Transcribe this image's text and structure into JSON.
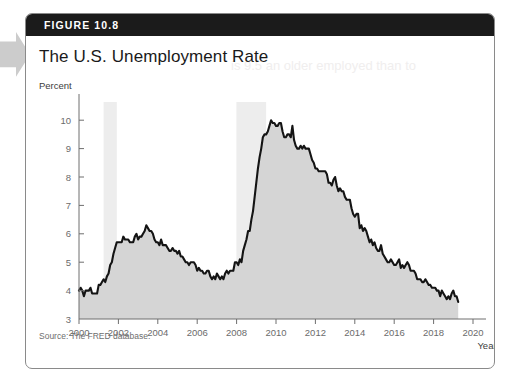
{
  "figure": {
    "header_label": "FIGURE 10.8",
    "title": "The U.S. Unemployment Rate",
    "source": "Source: The FRED database.",
    "bleed_text": "is 9.5 an older employed than to"
  },
  "colors": {
    "header_bg": "#1b1b1b",
    "header_text": "#ffffff",
    "line": "#141414",
    "area_fill": "#d5d5d5",
    "recession_band": "#ededed",
    "axis": "#6e6e6e",
    "tick_text": "#6b6b6b",
    "card_border": "#8a8a8a",
    "margin_tab": "#cccccc"
  },
  "chart_data": {
    "type": "line",
    "title": "The U.S. Unemployment Rate",
    "xlabel": "Year",
    "ylabel": "Percent",
    "xlim": [
      2000,
      2020
    ],
    "ylim": [
      3,
      10.5
    ],
    "xticks": [
      2000,
      2002,
      2004,
      2006,
      2008,
      2010,
      2012,
      2014,
      2016,
      2018,
      2020
    ],
    "yticks": [
      3,
      4,
      5,
      6,
      7,
      8,
      9,
      10
    ],
    "grid": false,
    "legend": null,
    "filled_area": true,
    "recession_bands": [
      {
        "start": 2001.25,
        "end": 2001.92,
        "label": "2001 recession"
      },
      {
        "start": 2007.99,
        "end": 2009.5,
        "label": "Great Recession"
      }
    ],
    "series": [
      {
        "name": "U.S. civilian unemployment rate (percent)",
        "x": [
          2000.0,
          2000.083,
          2000.167,
          2000.25,
          2000.333,
          2000.417,
          2000.5,
          2000.583,
          2000.667,
          2000.75,
          2000.833,
          2000.917,
          2001.0,
          2001.083,
          2001.167,
          2001.25,
          2001.333,
          2001.417,
          2001.5,
          2001.583,
          2001.667,
          2001.75,
          2001.833,
          2001.917,
          2002.0,
          2002.083,
          2002.167,
          2002.25,
          2002.333,
          2002.417,
          2002.5,
          2002.583,
          2002.667,
          2002.75,
          2002.833,
          2002.917,
          2003.0,
          2003.083,
          2003.167,
          2003.25,
          2003.333,
          2003.417,
          2003.5,
          2003.583,
          2003.667,
          2003.75,
          2003.833,
          2003.917,
          2004.0,
          2004.083,
          2004.167,
          2004.25,
          2004.333,
          2004.417,
          2004.5,
          2004.583,
          2004.667,
          2004.75,
          2004.833,
          2004.917,
          2005.0,
          2005.083,
          2005.167,
          2005.25,
          2005.333,
          2005.417,
          2005.5,
          2005.583,
          2005.667,
          2005.75,
          2005.833,
          2005.917,
          2006.0,
          2006.083,
          2006.167,
          2006.25,
          2006.333,
          2006.417,
          2006.5,
          2006.583,
          2006.667,
          2006.75,
          2006.833,
          2006.917,
          2007.0,
          2007.083,
          2007.167,
          2007.25,
          2007.333,
          2007.417,
          2007.5,
          2007.583,
          2007.667,
          2007.75,
          2007.833,
          2007.917,
          2008.0,
          2008.083,
          2008.167,
          2008.25,
          2008.333,
          2008.417,
          2008.5,
          2008.583,
          2008.667,
          2008.75,
          2008.833,
          2008.917,
          2009.0,
          2009.083,
          2009.167,
          2009.25,
          2009.333,
          2009.417,
          2009.5,
          2009.583,
          2009.667,
          2009.75,
          2009.833,
          2009.917,
          2010.0,
          2010.083,
          2010.167,
          2010.25,
          2010.333,
          2010.417,
          2010.5,
          2010.583,
          2010.667,
          2010.75,
          2010.833,
          2010.917,
          2011.0,
          2011.083,
          2011.167,
          2011.25,
          2011.333,
          2011.417,
          2011.5,
          2011.583,
          2011.667,
          2011.75,
          2011.833,
          2011.917,
          2012.0,
          2012.083,
          2012.167,
          2012.25,
          2012.333,
          2012.417,
          2012.5,
          2012.583,
          2012.667,
          2012.75,
          2012.833,
          2012.917,
          2013.0,
          2013.083,
          2013.167,
          2013.25,
          2013.333,
          2013.417,
          2013.5,
          2013.583,
          2013.667,
          2013.75,
          2013.833,
          2013.917,
          2014.0,
          2014.083,
          2014.167,
          2014.25,
          2014.333,
          2014.417,
          2014.5,
          2014.583,
          2014.667,
          2014.75,
          2014.833,
          2014.917,
          2015.0,
          2015.083,
          2015.167,
          2015.25,
          2015.333,
          2015.417,
          2015.5,
          2015.583,
          2015.667,
          2015.75,
          2015.833,
          2015.917,
          2016.0,
          2016.083,
          2016.167,
          2016.25,
          2016.333,
          2016.417,
          2016.5,
          2016.583,
          2016.667,
          2016.75,
          2016.833,
          2016.917,
          2017.0,
          2017.083,
          2017.167,
          2017.25,
          2017.333,
          2017.417,
          2017.5,
          2017.583,
          2017.667,
          2017.75,
          2017.833,
          2017.917,
          2018.0,
          2018.083,
          2018.167,
          2018.25,
          2018.333,
          2018.417,
          2018.5,
          2018.583,
          2018.667,
          2018.75,
          2018.833,
          2018.917,
          2019.0,
          2019.083,
          2019.167,
          2019.25
        ],
        "values": [
          4.0,
          4.1,
          4.0,
          3.8,
          4.0,
          4.0,
          4.0,
          4.1,
          3.9,
          3.9,
          3.9,
          3.9,
          4.2,
          4.2,
          4.3,
          4.4,
          4.3,
          4.5,
          4.6,
          4.9,
          5.0,
          5.3,
          5.5,
          5.7,
          5.7,
          5.7,
          5.7,
          5.9,
          5.8,
          5.8,
          5.8,
          5.7,
          5.7,
          5.7,
          5.9,
          6.0,
          5.8,
          5.9,
          5.9,
          6.0,
          6.1,
          6.3,
          6.2,
          6.1,
          6.1,
          6.0,
          5.8,
          5.7,
          5.7,
          5.6,
          5.8,
          5.6,
          5.6,
          5.6,
          5.5,
          5.4,
          5.4,
          5.5,
          5.4,
          5.4,
          5.3,
          5.4,
          5.2,
          5.2,
          5.1,
          5.0,
          5.0,
          4.9,
          5.0,
          5.0,
          5.0,
          4.9,
          4.7,
          4.8,
          4.7,
          4.7,
          4.6,
          4.6,
          4.7,
          4.7,
          4.5,
          4.4,
          4.5,
          4.4,
          4.6,
          4.5,
          4.4,
          4.5,
          4.4,
          4.6,
          4.7,
          4.6,
          4.7,
          4.7,
          4.7,
          5.0,
          5.0,
          4.9,
          5.1,
          5.0,
          5.4,
          5.6,
          5.8,
          6.1,
          6.1,
          6.5,
          6.8,
          7.3,
          7.8,
          8.3,
          8.7,
          9.0,
          9.4,
          9.5,
          9.5,
          9.6,
          9.8,
          10.0,
          9.9,
          9.9,
          9.8,
          9.8,
          9.9,
          9.9,
          9.6,
          9.4,
          9.4,
          9.5,
          9.5,
          9.4,
          9.8,
          9.3,
          9.1,
          9.0,
          9.0,
          9.1,
          9.0,
          9.1,
          9.0,
          9.0,
          9.0,
          8.8,
          8.6,
          8.5,
          8.3,
          8.3,
          8.2,
          8.2,
          8.2,
          8.2,
          8.2,
          8.1,
          7.8,
          7.8,
          7.7,
          7.9,
          8.0,
          7.7,
          7.5,
          7.6,
          7.5,
          7.5,
          7.3,
          7.2,
          7.2,
          7.2,
          6.9,
          6.7,
          6.6,
          6.7,
          6.7,
          6.2,
          6.3,
          6.1,
          6.2,
          6.1,
          5.9,
          5.7,
          5.8,
          5.6,
          5.7,
          5.5,
          5.4,
          5.4,
          5.6,
          5.3,
          5.2,
          5.1,
          5.0,
          5.0,
          5.1,
          5.0,
          4.9,
          4.9,
          5.0,
          5.1,
          4.8,
          4.9,
          4.8,
          4.9,
          5.0,
          4.9,
          4.7,
          4.7,
          4.7,
          4.6,
          4.4,
          4.4,
          4.4,
          4.3,
          4.3,
          4.4,
          4.3,
          4.2,
          4.2,
          4.1,
          4.1,
          4.1,
          4.0,
          4.0,
          3.8,
          4.0,
          3.9,
          3.8,
          3.7,
          3.8,
          3.7,
          3.9,
          4.0,
          3.8,
          3.8,
          3.6
        ]
      }
    ]
  }
}
